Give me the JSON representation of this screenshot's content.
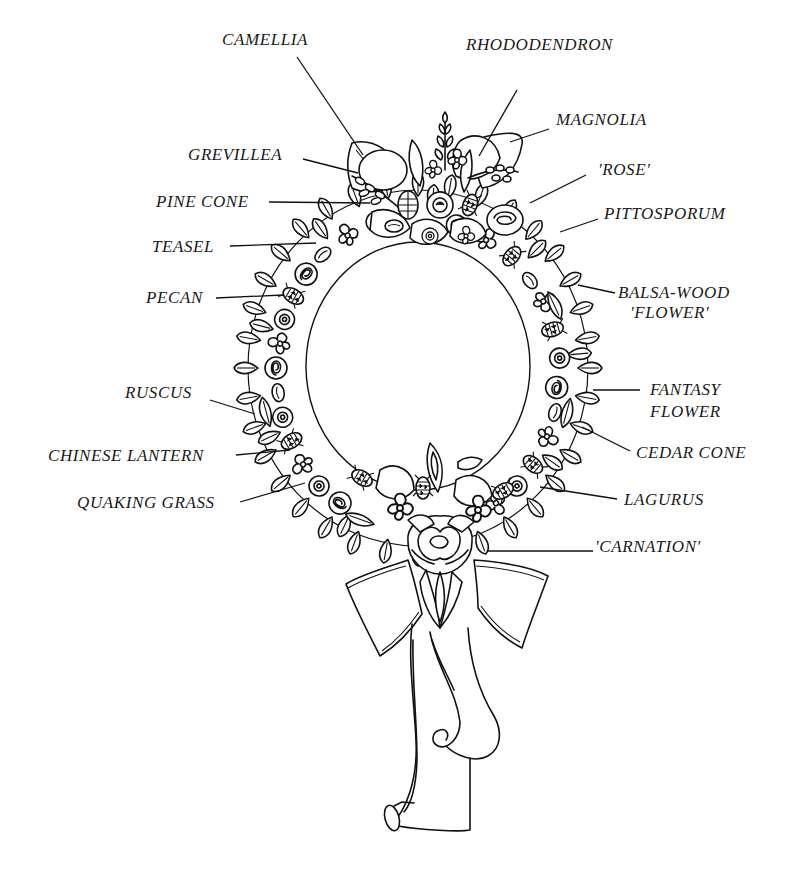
{
  "diagram": {
    "ink_color": "#111111",
    "background_color": "#ffffff",
    "labels": [
      {
        "id": "camellia",
        "text": "CAMELLIA",
        "x": 222,
        "y": 30,
        "align": "left",
        "leader": [
          [
            297,
            57
          ],
          [
            363,
            155
          ]
        ]
      },
      {
        "id": "rhododendron",
        "text": "RHODODENDRON",
        "x": 466,
        "y": 35,
        "align": "left",
        "leader": [
          [
            517,
            90
          ],
          [
            479,
            156
          ]
        ]
      },
      {
        "id": "magnolia",
        "text": "MAGNOLIA",
        "x": 556,
        "y": 110,
        "align": "left",
        "leader": [
          [
            549,
            129
          ],
          [
            510,
            142
          ]
        ]
      },
      {
        "id": "grevillea",
        "text": "GREVILLEA",
        "x": 188,
        "y": 145,
        "align": "left",
        "leader": [
          [
            303,
            159
          ],
          [
            358,
            173
          ]
        ]
      },
      {
        "id": "rose",
        "text": "'ROSE'",
        "x": 598,
        "y": 160,
        "align": "left",
        "leader": [
          [
            586,
            175
          ],
          [
            530,
            203
          ]
        ]
      },
      {
        "id": "pine-cone",
        "text": "PINE CONE",
        "x": 156,
        "y": 192,
        "align": "left",
        "leader": [
          [
            269,
            202
          ],
          [
            370,
            203
          ]
        ]
      },
      {
        "id": "pittosporum",
        "text": "PITTOSPORUM",
        "x": 604,
        "y": 204,
        "align": "left",
        "leader": [
          [
            598,
            219
          ],
          [
            560,
            232
          ]
        ]
      },
      {
        "id": "teasel",
        "text": "TEASEL",
        "x": 152,
        "y": 237,
        "align": "left",
        "leader": [
          [
            230,
            246
          ],
          [
            316,
            243
          ]
        ]
      },
      {
        "id": "balsa-wood-flower",
        "text": "BALSA-WOOD",
        "text2": "'FLOWER'",
        "x": 618,
        "y": 283,
        "align": "left",
        "leader": [
          [
            615,
            293
          ],
          [
            578,
            285
          ]
        ]
      },
      {
        "id": "pecan",
        "text": "PECAN",
        "x": 146,
        "y": 288,
        "align": "left",
        "leader": [
          [
            216,
            298
          ],
          [
            283,
            295
          ]
        ]
      },
      {
        "id": "ruscus",
        "text": "RUSCUS",
        "x": 125,
        "y": 383,
        "align": "left",
        "leader": [
          [
            210,
            400
          ],
          [
            255,
            414
          ]
        ]
      },
      {
        "id": "fantasy-flower",
        "text": "FANTASY",
        "text2": "FLOWER",
        "x": 650,
        "y": 380,
        "align": "left",
        "leader": [
          [
            640,
            390
          ],
          [
            593,
            390
          ]
        ]
      },
      {
        "id": "cedar-cone",
        "text": "CEDAR CONE",
        "x": 636,
        "y": 443,
        "align": "left",
        "leader": [
          [
            630,
            451
          ],
          [
            582,
            427
          ]
        ]
      },
      {
        "id": "chinese-lantern",
        "text": "CHINESE LANTERN",
        "x": 48,
        "y": 446,
        "align": "left",
        "leader": [
          [
            236,
            455
          ],
          [
            290,
            450
          ]
        ]
      },
      {
        "id": "quaking-grass",
        "text": "QUAKING GRASS",
        "x": 77,
        "y": 493,
        "align": "left",
        "leader": [
          [
            240,
            502
          ],
          [
            305,
            483
          ]
        ]
      },
      {
        "id": "lagurus",
        "text": "LAGURUS",
        "x": 624,
        "y": 490,
        "align": "left",
        "leader": [
          [
            617,
            499
          ],
          [
            540,
            487
          ]
        ]
      },
      {
        "id": "carnation",
        "text": "'CARNATION'",
        "x": 595,
        "y": 537,
        "align": "left",
        "leader": [
          [
            593,
            551
          ],
          [
            487,
            551
          ]
        ]
      }
    ]
  }
}
